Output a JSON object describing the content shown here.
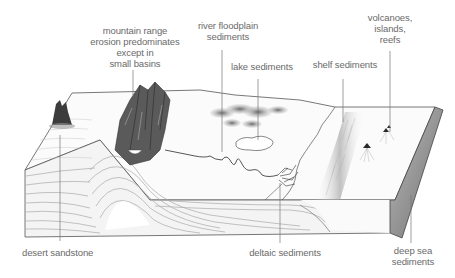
{
  "diagram": {
    "type": "geological block diagram",
    "labels": {
      "mountain_range": "mountain range\nerosion predominates\nexcept in\nsmall basins",
      "river_floodplain": "river floodplain\nsediments",
      "lake": "lake sediments",
      "shelf": "shelf sediments",
      "volcanoes": "volcanoes,\nislands,\nreefs",
      "desert": "desert sandstone",
      "deltaic": "deltaic sediments",
      "deep_sea": "deep sea\nsediments"
    },
    "colors": {
      "label_text": "#6a6a6a",
      "leader_line": "#777777",
      "outline": "#555555",
      "shading_dark": "#3a3a3a",
      "shading_mid": "#9a9a9a",
      "shading_light": "#d4d4d4"
    }
  }
}
